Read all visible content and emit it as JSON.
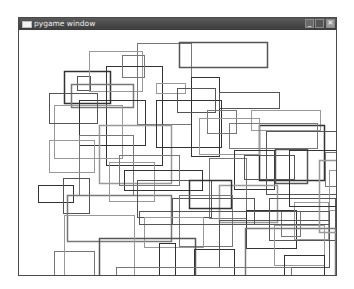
{
  "window": {
    "title": "pygame window",
    "buttons": {
      "minimize": "_",
      "maximize": "□",
      "close": "✕"
    }
  },
  "canvas": {
    "background": "#ffffff",
    "stroke_colors": [
      "#333333",
      "#555555",
      "#777777",
      "#999999"
    ],
    "rects": [
      [
        45,
        41,
        46,
        32
      ],
      [
        58,
        46,
        13,
        14
      ],
      [
        118,
        13,
        54,
        81
      ],
      [
        70,
        21,
        53,
        40
      ],
      [
        87,
        36,
        56,
        99
      ],
      [
        160,
        12,
        88,
        25
      ],
      [
        103,
        25,
        22,
        22
      ],
      [
        137,
        53,
        29,
        10
      ],
      [
        172,
        47,
        28,
        79
      ],
      [
        200,
        62,
        60,
        16
      ],
      [
        52,
        54,
        62,
        23
      ],
      [
        35,
        75,
        68,
        53
      ],
      [
        60,
        70,
        66,
        45
      ],
      [
        30,
        63,
        48,
        30
      ],
      [
        60,
        105,
        54,
        60
      ],
      [
        80,
        95,
        72,
        58
      ],
      [
        137,
        70,
        65,
        47
      ],
      [
        158,
        58,
        38,
        24
      ],
      [
        188,
        80,
        29,
        23
      ],
      [
        232,
        80,
        69,
        20
      ],
      [
        240,
        95,
        65,
        55
      ],
      [
        247,
        101,
        72,
        63
      ],
      [
        210,
        93,
        88,
        25
      ],
      [
        180,
        88,
        60,
        36
      ],
      [
        215,
        120,
        40,
        39
      ],
      [
        256,
        119,
        32,
        34
      ],
      [
        306,
        122,
        28,
        34
      ],
      [
        310,
        140,
        20,
        40
      ],
      [
        19,
        155,
        35,
        17
      ],
      [
        44,
        148,
        26,
        35
      ],
      [
        48,
        165,
        104,
        46
      ],
      [
        90,
        132,
        45,
        39
      ],
      [
        105,
        140,
        78,
        20
      ],
      [
        118,
        150,
        74,
        37
      ],
      [
        190,
        128,
        37,
        60
      ],
      [
        200,
        155,
        58,
        37
      ],
      [
        227,
        180,
        50,
        38
      ],
      [
        250,
        168,
        66,
        42
      ],
      [
        262,
        181,
        19,
        25
      ],
      [
        275,
        172,
        34,
        37
      ],
      [
        170,
        150,
        42,
        28
      ],
      [
        153,
        168,
        82,
        26
      ],
      [
        160,
        165,
        53,
        51
      ],
      [
        125,
        187,
        59,
        30
      ],
      [
        140,
        213,
        16,
        44
      ],
      [
        80,
        208,
        96,
        58
      ],
      [
        35,
        221,
        40,
        38
      ],
      [
        45,
        185,
        70,
        78
      ],
      [
        175,
        219,
        40,
        43
      ],
      [
        200,
        190,
        110,
        47
      ],
      [
        226,
        198,
        90,
        48
      ],
      [
        255,
        195,
        50,
        40
      ],
      [
        265,
        225,
        40,
        20
      ],
      [
        120,
        181,
        190,
        13
      ],
      [
        97,
        237,
        175,
        14
      ],
      [
        300,
        130,
        34,
        72
      ],
      [
        270,
        120,
        48,
        56
      ],
      [
        225,
        125,
        50,
        24
      ],
      [
        100,
        125,
        60,
        30
      ],
      [
        30,
        110,
        45,
        32
      ]
    ]
  }
}
